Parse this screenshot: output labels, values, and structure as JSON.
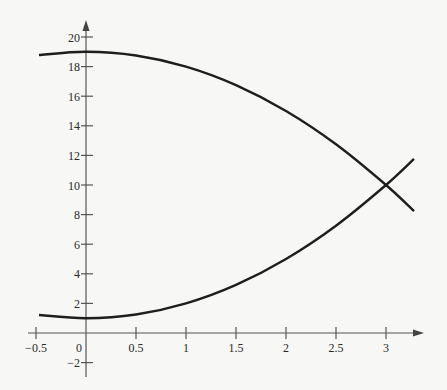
{
  "chart_data": {
    "type": "line",
    "title": "",
    "xlabel": "",
    "ylabel": "",
    "xlim": [
      -0.5,
      3.3
    ],
    "ylim": [
      -2,
      21
    ],
    "grid": false,
    "legend": null,
    "x_ticks": [
      {
        "value": -0.5,
        "label": "−0.5"
      },
      {
        "value": 0,
        "label": "0"
      },
      {
        "value": 0.5,
        "label": "0.5"
      },
      {
        "value": 1,
        "label": "1"
      },
      {
        "value": 1.5,
        "label": "1.5"
      },
      {
        "value": 2,
        "label": "2"
      },
      {
        "value": 2.5,
        "label": "2.5"
      },
      {
        "value": 3,
        "label": "3"
      }
    ],
    "y_ticks": [
      {
        "value": -2,
        "label": "−2"
      },
      {
        "value": 2,
        "label": "2"
      },
      {
        "value": 4,
        "label": "4"
      },
      {
        "value": 6,
        "label": "6"
      },
      {
        "value": 8,
        "label": "8"
      },
      {
        "value": 10,
        "label": "10"
      },
      {
        "value": 12,
        "label": "12"
      },
      {
        "value": 14,
        "label": "14"
      },
      {
        "value": 16,
        "label": "16"
      },
      {
        "value": 18,
        "label": "18"
      },
      {
        "value": 20,
        "label": "20"
      }
    ],
    "series": [
      {
        "name": "upper curve (decreasing)",
        "x": [
          -0.47,
          0,
          0.5,
          1,
          1.5,
          2,
          2.5,
          3,
          3.28
        ],
        "y": [
          18.78,
          19,
          18.75,
          18,
          16.75,
          15,
          12.75,
          10,
          8.24
        ]
      },
      {
        "name": "lower curve (increasing)",
        "x": [
          -0.47,
          0,
          0.5,
          1,
          1.5,
          2,
          2.5,
          3,
          3.28
        ],
        "y": [
          1.22,
          1,
          1.25,
          2,
          3.25,
          5,
          7.25,
          10,
          11.76
        ]
      }
    ],
    "annotations": [
      {
        "type": "intersection",
        "x": 3,
        "y": 10
      }
    ]
  }
}
